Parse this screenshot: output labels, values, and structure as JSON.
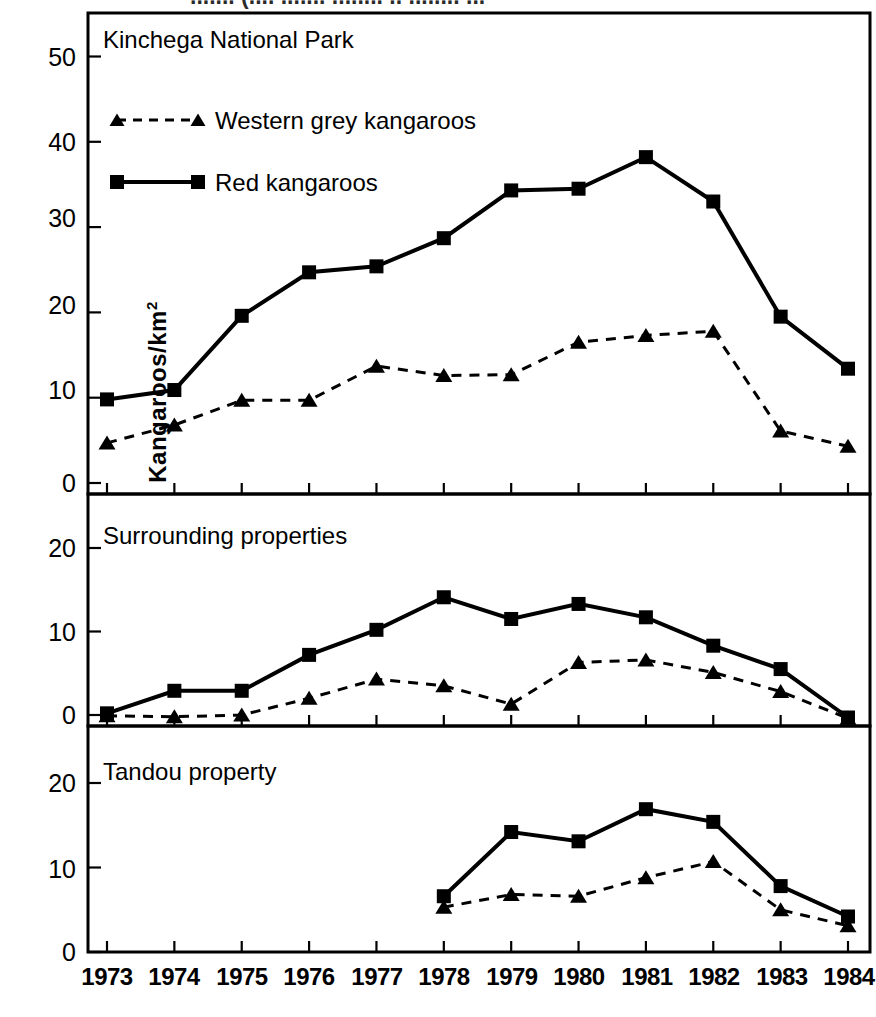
{
  "figure": {
    "y_axis_label": "Kangaroos/km",
    "y_axis_label_exponent": "2",
    "cropped_caption_fragment": "....... (.... ....... ........ .. ........ ..."
  },
  "panels": [
    {
      "title": "Kinchega National Park",
      "y_ticks": [
        "0",
        "10",
        "20",
        "30",
        "40",
        "50"
      ]
    },
    {
      "title": "Surrounding properties",
      "y_ticks": [
        "0",
        "10",
        "20"
      ]
    },
    {
      "title": "Tandou property",
      "y_ticks": [
        "0",
        "10",
        "20"
      ]
    }
  ],
  "legend": {
    "items": [
      {
        "label": "Western grey kangaroos",
        "style": "dashed-triangle",
        "color": "#000000"
      },
      {
        "label": "Red kangaroos",
        "style": "solid-square",
        "color": "#000000"
      }
    ]
  },
  "x_tick_labels": [
    "1973",
    "1974",
    "1975",
    "1976",
    "1977",
    "1978",
    "1979",
    "1980",
    "1981",
    "1982",
    "1983",
    "1984"
  ],
  "chart_data": [
    {
      "type": "line",
      "title": "Kinchega National Park",
      "xlabel": "",
      "ylabel": "Kangaroos/km2",
      "x": [
        1973,
        1974,
        1975,
        1976,
        1977,
        1978,
        1979,
        1980,
        1981,
        1982,
        1983,
        1984
      ],
      "xlim": [
        1972.7,
        1984.3
      ],
      "ylim": [
        -2,
        54
      ],
      "yticks": [
        0,
        10,
        20,
        30,
        40,
        50
      ],
      "grid": false,
      "legend_position": "upper-left-inside",
      "series": [
        {
          "name": "Red kangaroos",
          "marker": "square",
          "line": "solid",
          "values": [
            9.8,
            10.9,
            19.6,
            24.7,
            25.4,
            28.7,
            34.3,
            34.5,
            38.2,
            33.0,
            19.5,
            13.4
          ]
        },
        {
          "name": "Western grey kangaroos",
          "marker": "triangle",
          "line": "dashed",
          "values": [
            4.7,
            6.8,
            9.7,
            9.7,
            13.7,
            12.6,
            12.7,
            16.5,
            17.3,
            17.8,
            6.1,
            4.3
          ]
        }
      ]
    },
    {
      "type": "line",
      "title": "Surrounding properties",
      "xlabel": "",
      "ylabel": "Kangaroos/km2",
      "x": [
        1973,
        1974,
        1975,
        1976,
        1977,
        1978,
        1979,
        1980,
        1981,
        1982,
        1983,
        1984
      ],
      "xlim": [
        1972.7,
        1984.3
      ],
      "ylim": [
        -1.5,
        25
      ],
      "yticks": [
        0,
        10,
        20
      ],
      "grid": false,
      "legend_position": "none",
      "series": [
        {
          "name": "Red kangaroos",
          "marker": "square",
          "line": "solid",
          "values": [
            0.2,
            2.9,
            2.9,
            7.2,
            10.2,
            14.1,
            11.5,
            13.3,
            11.7,
            8.3,
            5.5,
            -0.3
          ]
        },
        {
          "name": "Western grey kangaroos",
          "marker": "triangle",
          "line": "dashed",
          "values": [
            -0.1,
            -0.2,
            0.0,
            2.0,
            4.3,
            3.5,
            1.3,
            6.3,
            6.6,
            5.1,
            2.8,
            -0.4
          ]
        }
      ]
    },
    {
      "type": "line",
      "title": "Tandou property",
      "xlabel": "",
      "ylabel": "Kangaroos/km2",
      "x": [
        1978,
        1979,
        1980,
        1981,
        1982,
        1983,
        1984
      ],
      "xlim": [
        1972.7,
        1984.3
      ],
      "ylim": [
        -1.5,
        25
      ],
      "yticks": [
        0,
        10,
        20
      ],
      "grid": false,
      "legend_position": "none",
      "series": [
        {
          "name": "Red kangaroos",
          "marker": "square",
          "line": "solid",
          "values": [
            6.6,
            14.2,
            13.1,
            16.9,
            15.4,
            7.8,
            4.2
          ]
        },
        {
          "name": "Western grey kangaroos",
          "marker": "triangle",
          "line": "dashed",
          "values": [
            5.3,
            6.8,
            6.6,
            8.8,
            10.7,
            5.0,
            3.1
          ]
        }
      ]
    }
  ]
}
